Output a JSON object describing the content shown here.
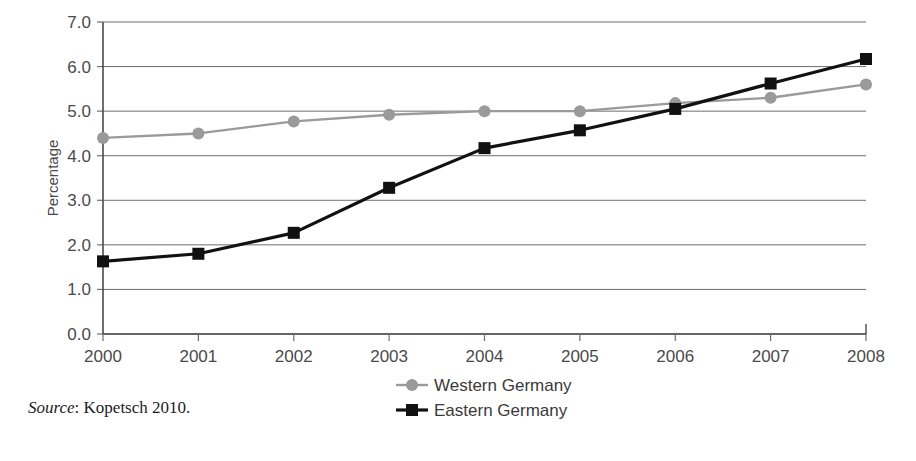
{
  "chart_data": {
    "type": "line",
    "title": "",
    "subtitle": "",
    "xlabel": "",
    "ylabel": "Percentage",
    "categories": [
      "2000",
      "2001",
      "2002",
      "2003",
      "2004",
      "2005",
      "2006",
      "2007",
      "2008"
    ],
    "x": [
      2000,
      2001,
      2002,
      2003,
      2004,
      2005,
      2006,
      2007,
      2008
    ],
    "series": [
      {
        "name": "Western Germany",
        "color": "#9a9a9a",
        "marker": "circle",
        "values": [
          4.4,
          4.5,
          4.77,
          4.92,
          5.0,
          5.0,
          5.18,
          5.3,
          5.6
        ]
      },
      {
        "name": "Eastern Germany",
        "color": "#111111",
        "marker": "square",
        "values": [
          1.63,
          1.8,
          2.27,
          3.28,
          4.17,
          4.57,
          5.05,
          5.62,
          6.17
        ]
      }
    ],
    "ylim": [
      0.0,
      7.0
    ],
    "ytick_step": 1.0,
    "yticks": [
      "0.0",
      "1.0",
      "2.0",
      "3.0",
      "4.0",
      "5.0",
      "6.0",
      "7.0"
    ],
    "grid": "horizontal",
    "legend_position": "bottom-center"
  },
  "source": {
    "label": "Source",
    "separator": ": ",
    "text": "Kopetsch 2010."
  }
}
